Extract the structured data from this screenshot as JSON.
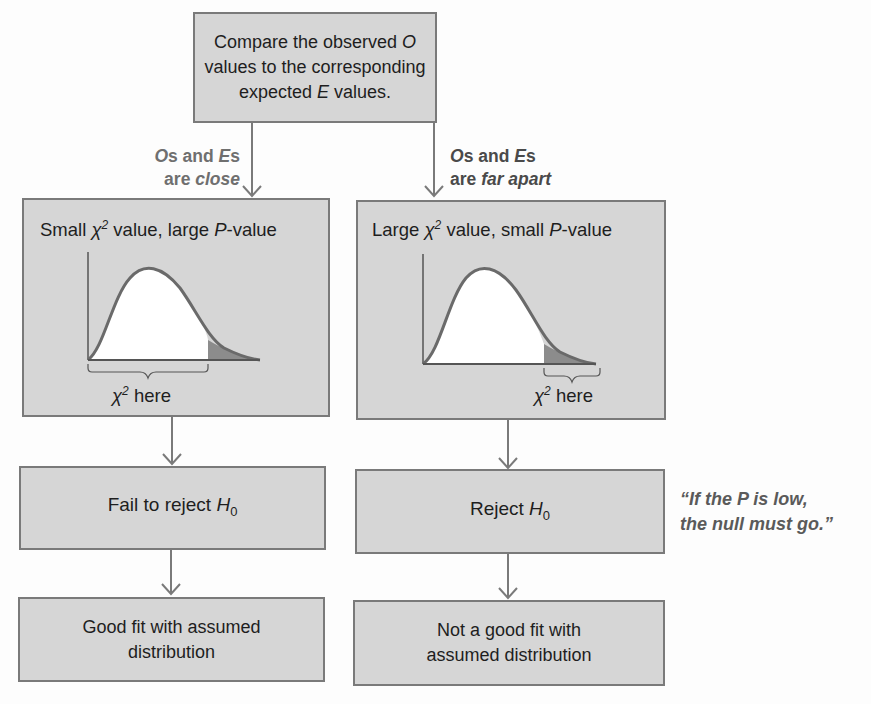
{
  "top_box": {
    "line1": "Compare the observed",
    "line1_var": "O",
    "line2": "values to the corresponding",
    "line3_pre": "expected",
    "line3_var": "E",
    "line3_post": "values."
  },
  "branch_labels": {
    "left": {
      "line1_var1": "O",
      "line1_mid": "s and ",
      "line1_var2": "E",
      "line1_end": "s",
      "line2_pre": "are ",
      "line2_it": "close"
    },
    "right": {
      "line1_var1": "O",
      "line1_mid": "s and ",
      "line1_var2": "E",
      "line1_end": "s",
      "line2_pre": "are ",
      "line2_it": "far apart"
    }
  },
  "left_chart_box": {
    "title_pre": "Small ",
    "chi": "χ",
    "sup": "2",
    "title_mid": " value, large ",
    "title_var": "P",
    "title_post": "-value",
    "brace_label_chi": "χ",
    "brace_label_sup": "2",
    "brace_label_text": " here"
  },
  "right_chart_box": {
    "title_pre": "Large ",
    "chi": "χ",
    "sup": "2",
    "title_mid": " value, small ",
    "title_var": "P",
    "title_post": "-value",
    "brace_label_chi": "χ",
    "brace_label_sup": "2",
    "brace_label_text": " here"
  },
  "decision": {
    "left_text": "Fail to reject ",
    "left_var": "H",
    "left_sub": "0",
    "right_text": "Reject ",
    "right_var": "H",
    "right_sub": "0"
  },
  "conclusion": {
    "left_line1": "Good fit with assumed",
    "left_line2": "distribution",
    "right_line1": "Not a good fit with",
    "right_line2": "assumed distribution"
  },
  "quote": {
    "line1": "“If the P is low,",
    "line2": "the null must go.”"
  },
  "colors": {
    "box_fill": "#d6d6d6",
    "box_border": "#7a7a7a",
    "curve": "#6a6a6a",
    "tail_shade": "#8c8c8c",
    "label_light": "#6f6f6f",
    "label_dark": "#4a4a4a"
  }
}
